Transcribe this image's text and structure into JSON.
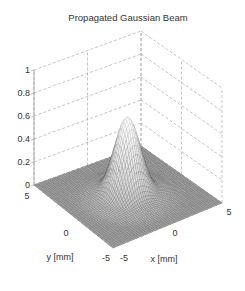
{
  "chart_data": {
    "type": "surface",
    "title": "Propagated Gaussian Beam",
    "xlabel": "x [mm]",
    "ylabel": "y [mm]",
    "zlabel": "",
    "xlim": [
      -5,
      5
    ],
    "ylim": [
      -5,
      5
    ],
    "zlim": [
      0,
      1
    ],
    "xticks": [
      -5,
      0,
      5
    ],
    "yticks": [
      -5,
      0,
      5
    ],
    "zticks": [
      0,
      0.2,
      0.4,
      0.6,
      0.8,
      1
    ],
    "xtick_labels": [
      "-5",
      "0",
      "5"
    ],
    "ytick_labels": [
      "-5",
      "0",
      "5"
    ],
    "ztick_labels": [
      "0",
      "0.2",
      "0.4",
      "0.6",
      "0.8",
      "1"
    ],
    "grid": true,
    "surface": {
      "function": "gaussian",
      "peak_amplitude": 0.68,
      "center": [
        0,
        0
      ],
      "beam_radius_mm": 1.4,
      "ring_amplitude": 0.02,
      "mesh_points": 61,
      "colormap": "gray"
    }
  },
  "colors": {
    "grid": "#9a9a9a",
    "axis": "#999999",
    "mesh_edge": "#5a5a5a",
    "text": "#333333"
  }
}
